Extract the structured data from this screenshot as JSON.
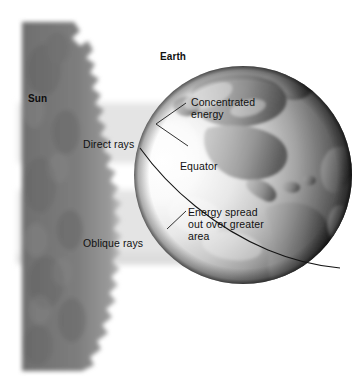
{
  "figure": {
    "background_color": "#ffffff",
    "width": 362,
    "height": 386
  },
  "labels": {
    "sun": "Sun",
    "earth": "Earth",
    "direct_rays": "Direct rays",
    "oblique_rays": "Oblique rays",
    "concentrated_energy_line1": "Concentrated",
    "concentrated_energy_line2": "energy",
    "equator": "Equator",
    "energy_spread_line1": "Energy spread",
    "energy_spread_line2": "out over greater",
    "energy_spread_line3": "area"
  },
  "colors": {
    "sun_fill": "#7b7b7b",
    "ray_band": "#e2e2e2",
    "globe_light": "#f2f2f2",
    "globe_dark": "#0a0a0a",
    "land": "#8d8d8d",
    "leader_line": "#1a1a1a",
    "text": "#111111",
    "page": "#ffffff"
  },
  "geometry": {
    "globe_center_x": 243,
    "globe_center_y": 175,
    "globe_radius": 109,
    "sun_left": 22,
    "sun_top": 22,
    "sun_bottom": 371,
    "direct_band_top": 103,
    "direct_band_bottom": 163,
    "oblique_band_top": 190,
    "oblique_band_bottom": 262
  }
}
